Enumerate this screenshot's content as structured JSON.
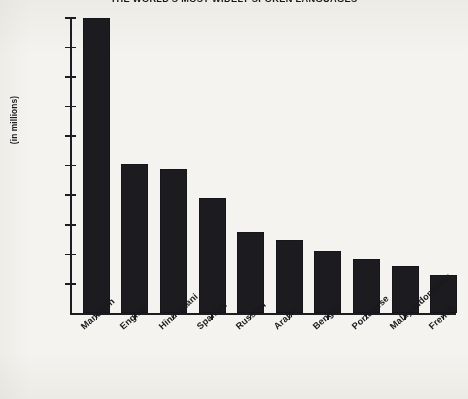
{
  "chart_data": {
    "type": "bar",
    "title": "THE WORLD'S MOST WIDELY SPOKEN LANGUAGES",
    "xlabel": "",
    "ylabel": "(in millions)",
    "ylim": [
      0,
      1000
    ],
    "grid": false,
    "legend": "none",
    "categories": [
      "Mandarin",
      "English",
      "Hindustani",
      "Spanish",
      "Russian",
      "Arabic",
      "Bengali",
      "Portugese",
      "Malay-Indonesian",
      "French"
    ],
    "values": [
      1000,
      505,
      490,
      390,
      277,
      247,
      211,
      185,
      160,
      130
    ],
    "ytick_labels": [
      "100",
      "200",
      "300",
      "400",
      "500",
      "600",
      "700",
      "800",
      "900",
      "1,000"
    ],
    "ytick_values": [
      100,
      200,
      300,
      400,
      500,
      600,
      700,
      800,
      900,
      1000
    ],
    "bar_color": "#1c1b1f",
    "background_color": "#f4f3ef",
    "axis_color": "#1d1c20"
  }
}
